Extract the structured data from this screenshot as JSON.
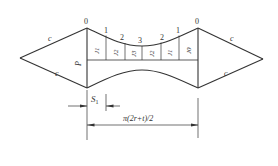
{
  "diagram": {
    "type": "technical-drawing",
    "stroke_color": "#333333",
    "background": "#ffffff",
    "top_station_labels": [
      "0",
      "1",
      "2",
      "3",
      "2",
      "1",
      "0"
    ],
    "cell_labels": [
      "J1",
      "J2",
      "J3",
      "J2",
      "J1",
      "J0"
    ],
    "edge_labels": {
      "left_upper": "c",
      "left_lower": "c",
      "right_upper": "c",
      "right_lower": "c",
      "left_height": "P"
    },
    "dimensions": {
      "s1": {
        "label_main": "S",
        "label_sub": "1"
      },
      "half_circumference": {
        "label": "π(2r+t)/2"
      }
    }
  }
}
